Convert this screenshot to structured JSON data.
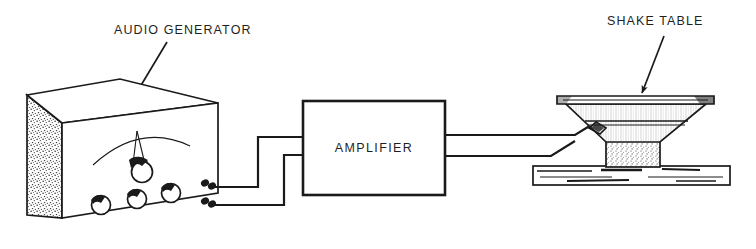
{
  "figure": {
    "type": "technical-line-diagram",
    "background_color": "#ffffff",
    "ink_color": "#1a1a1a"
  },
  "labels": {
    "audio_generator": "AUDIO GENERATOR",
    "shake_table": "SHAKE TABLE",
    "amplifier": "AMPLIFIER"
  },
  "components": {
    "generator": {
      "name": "audio-generator",
      "description": "isometric instrument case with stippled left side panel",
      "front_panel": {
        "meter_name": "meter-arc",
        "main_dial_name": "main-dial-knob",
        "knob_count": 3,
        "terminal_count": 2
      }
    },
    "amplifier": {
      "name": "amplifier",
      "description": "rectangular block with two input leads at left and two output leads at right",
      "input_leads": 2,
      "output_leads": 2
    },
    "shake_table": {
      "name": "shake-table",
      "description": "loudspeaker driver in cross section with flared cone, stippled magnet base, mounted on a wooden board",
      "mount": "wood-board"
    }
  },
  "wiring": {
    "generator_to_amplifier": 2,
    "amplifier_to_speaker": 2
  }
}
